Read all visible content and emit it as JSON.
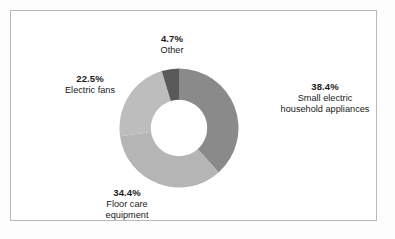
{
  "figure": {
    "background_color": "#fdfdfd",
    "panel_color": "#ffffff",
    "border_color": "#b9b9b9"
  },
  "labels": {
    "small_electric": {
      "percent": "38.4%",
      "line1": "Small electric",
      "line2": "household appliances"
    },
    "electric_fans": {
      "percent": "22.5%",
      "line1": "Electric fans"
    },
    "floor_care": {
      "percent": "34.4%",
      "line1": "Floor care",
      "line2": "equipment"
    },
    "other": {
      "percent": "4.7%",
      "line1": "Other"
    }
  },
  "chart_data": {
    "type": "pie",
    "variant": "donut",
    "title": "",
    "xlabel": "",
    "ylabel": "",
    "start_angle_deg": 0,
    "direction": "clockwise",
    "inner_radius_ratio": 0.47,
    "legend_position": "none",
    "labels_position": "outside",
    "grid": false,
    "categories": [
      "Small electric household appliances",
      "Floor care equipment",
      "Electric fans",
      "Other"
    ],
    "values": [
      38.4,
      34.4,
      22.5,
      4.7
    ],
    "value_labels": [
      "38.4%",
      "34.4%",
      "22.5%",
      "4.7%"
    ],
    "colors": [
      "#8a8a8a",
      "#b5b5b5",
      "#bdbdbd",
      "#595959"
    ],
    "slices": [
      {
        "name": "Small electric household appliances",
        "value": 38.4,
        "label": "38.4%",
        "color": "#8a8a8a",
        "start_deg": 0.0,
        "end_deg": 138.24
      },
      {
        "name": "Floor care equipment",
        "value": 34.4,
        "label": "34.4%",
        "color": "#b5b5b5",
        "start_deg": 138.24,
        "end_deg": 262.08
      },
      {
        "name": "Electric fans",
        "value": 22.5,
        "label": "22.5%",
        "color": "#bdbdbd",
        "start_deg": 262.08,
        "end_deg": 343.08
      },
      {
        "name": "Other",
        "value": 4.7,
        "label": "4.7%",
        "color": "#595959",
        "start_deg": 343.08,
        "end_deg": 360.0
      }
    ],
    "total": 100.0
  }
}
